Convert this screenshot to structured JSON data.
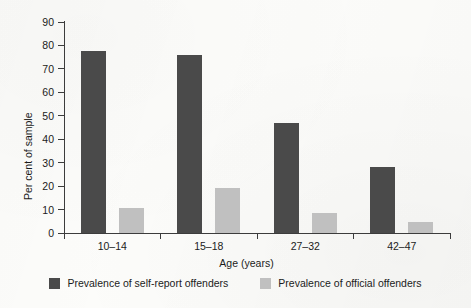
{
  "chart_data": {
    "type": "bar",
    "title": "",
    "xlabel": "Age (years)",
    "ylabel": "Per cent of sample",
    "categories": [
      "10–14",
      "15–18",
      "27–32",
      "42–47"
    ],
    "series": [
      {
        "name": "Prevalence of self-report offenders",
        "color": "#4a4a4a",
        "values": [
          77.5,
          76,
          47,
          28
        ]
      },
      {
        "name": "Prevalence of official offenders",
        "color": "#c0c0c0",
        "values": [
          10.5,
          19,
          8.5,
          4.5
        ]
      }
    ],
    "ylim": [
      0,
      90
    ],
    "ytick_step": 10,
    "yticks": [
      0,
      10,
      20,
      30,
      40,
      50,
      60,
      70,
      80,
      90
    ],
    "ytick_labels": [
      "0",
      "10",
      "20",
      "30",
      "40",
      "50",
      "60",
      "70",
      "80",
      "90"
    ],
    "grid": false,
    "legend_position": "bottom"
  },
  "legend": {
    "items": [
      {
        "label": "Prevalence of self-report offenders",
        "color": "#4a4a4a",
        "swatch": "dark"
      },
      {
        "label": "Prevalence of official offenders",
        "color": "#c0c0c0",
        "swatch": "light"
      }
    ]
  },
  "colors": {
    "dark_bar": "#4a4a4a",
    "light_bar": "#c0c0c0",
    "axis": "#3c3c3c",
    "text": "#1b1b1b",
    "background": "#fcfcfa"
  }
}
